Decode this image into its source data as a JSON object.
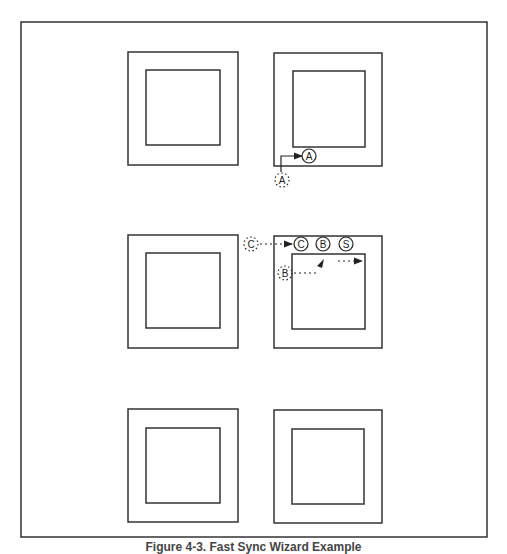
{
  "figure": {
    "caption": "Figure 4-3. Fast Sync Wizard Example",
    "stroke_color": "#333333",
    "background": "#ffffff"
  },
  "panels": [
    {
      "id": "top-left",
      "row": 1,
      "col": 1
    },
    {
      "id": "top-right",
      "row": 1,
      "col": 2,
      "markers": [
        {
          "label": "A",
          "style": "solid-circle"
        },
        {
          "label": "A",
          "style": "dashed-circle"
        }
      ]
    },
    {
      "id": "middle-left",
      "row": 2,
      "col": 1
    },
    {
      "id": "middle-right",
      "row": 2,
      "col": 2,
      "markers": [
        {
          "label": "C",
          "style": "dashed-circle"
        },
        {
          "label": "C",
          "style": "solid-circle"
        },
        {
          "label": "B",
          "style": "solid-circle"
        },
        {
          "label": "S",
          "style": "solid-circle"
        },
        {
          "label": "B",
          "style": "dashed-circle"
        }
      ]
    },
    {
      "id": "bottom-left",
      "row": 3,
      "col": 1
    },
    {
      "id": "bottom-right",
      "row": 3,
      "col": 2
    }
  ],
  "labels": {
    "a_solid": "A",
    "a_dashed": "A",
    "c_dashed": "C",
    "c_solid": "C",
    "b_solid": "B",
    "s_solid": "S",
    "b_dashed": "B"
  }
}
